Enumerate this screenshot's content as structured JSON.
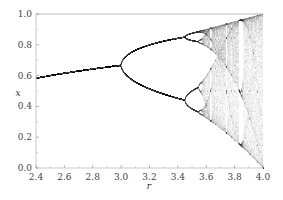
{
  "chart_data": {
    "type": "scatter",
    "title": "",
    "xlabel": "r",
    "ylabel": "x",
    "xlim": [
      2.4,
      4.0
    ],
    "ylim": [
      0.0,
      1.0
    ],
    "x_ticks": [
      "2.4",
      "2.6",
      "2.8",
      "3.0",
      "3.2",
      "3.4",
      "3.6",
      "3.8",
      "4.0"
    ],
    "y_ticks": [
      "0.0",
      "0.2",
      "0.4",
      "0.6",
      "0.8",
      "1.0"
    ],
    "grid": false,
    "legend": null,
    "point_color": "#555555",
    "key_points": [
      {
        "r": 2.4,
        "x": 0.583,
        "note": "single fixed point"
      },
      {
        "r": 3.0,
        "x": 0.667,
        "note": "first period-doubling bifurcation"
      },
      {
        "r": 3.449,
        "x": [
          0.44,
          0.85
        ],
        "note": "period-4 onset"
      },
      {
        "r": 3.57,
        "note": "onset of chaos"
      },
      {
        "r": 3.83,
        "note": "period-3 window"
      },
      {
        "r": 4.0,
        "x": [
          0.0,
          1.0
        ],
        "note": "full chaos"
      }
    ],
    "series": [
      {
        "name": "attractor",
        "map": "logistic",
        "r_min": 2.4,
        "r_max": 4.0,
        "r_steps": 900,
        "transient": 300,
        "samples": 120
      }
    ]
  }
}
